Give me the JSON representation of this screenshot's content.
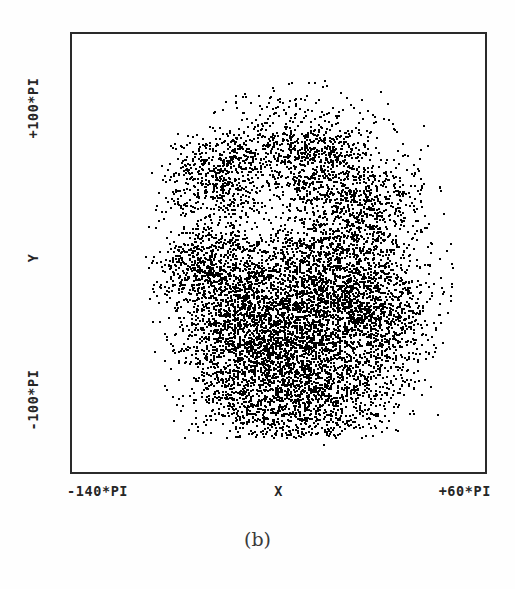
{
  "figure": {
    "caption": "(b)"
  },
  "axes": {
    "y_top_label": "+100*PI",
    "y_mid_label": "Y",
    "y_bottom_label": "-100*PI",
    "x_left_label": "-140*PI",
    "x_mid_label": "X",
    "x_right_label": "+60*PI"
  },
  "chart_data": {
    "type": "scatter",
    "title": "(b)",
    "xlabel": "X",
    "ylabel": "Y",
    "xtick_labels": [
      "-140*PI",
      "+60*PI"
    ],
    "ytick_labels": [
      "-100*PI",
      "+100*PI"
    ],
    "xlim": [
      -140,
      60
    ],
    "ylim": [
      -100,
      100
    ],
    "x_units": "PI",
    "y_units": "PI",
    "grid": false,
    "legend": null,
    "marker_color": "#000000",
    "background_color": "#ffffff",
    "frame_color": "#2a2a2a",
    "point_count_approx": 12000,
    "marker_size_px": 2,
    "cloud_extent_fraction": {
      "x_min": 0.22,
      "x_max": 0.88,
      "y_min": 0.15,
      "y_max": 0.89
    },
    "density_blobs": [
      {
        "cx": 0.34,
        "cy": 0.34,
        "rx": 0.075,
        "ry": 0.075,
        "weight": 0.055,
        "striation": 0.3
      },
      {
        "cx": 0.61,
        "cy": 0.3,
        "rx": 0.085,
        "ry": 0.07,
        "weight": 0.055,
        "striation": 0.3
      },
      {
        "cx": 0.52,
        "cy": 0.6,
        "rx": 0.15,
        "ry": 0.13,
        "weight": 0.2,
        "striation": 0.8
      },
      {
        "cx": 0.62,
        "cy": 0.72,
        "rx": 0.14,
        "ry": 0.13,
        "weight": 0.185,
        "striation": 0.85
      },
      {
        "cx": 0.45,
        "cy": 0.74,
        "rx": 0.12,
        "ry": 0.12,
        "weight": 0.15,
        "striation": 0.75
      },
      {
        "cx": 0.66,
        "cy": 0.5,
        "rx": 0.09,
        "ry": 0.09,
        "weight": 0.075,
        "striation": 0.55
      },
      {
        "cx": 0.38,
        "cy": 0.58,
        "rx": 0.08,
        "ry": 0.09,
        "weight": 0.06,
        "striation": 0.45
      },
      {
        "cx": 0.29,
        "cy": 0.53,
        "rx": 0.055,
        "ry": 0.05,
        "weight": 0.03,
        "striation": 0.2
      },
      {
        "cx": 0.74,
        "cy": 0.62,
        "rx": 0.075,
        "ry": 0.075,
        "weight": 0.05,
        "striation": 0.4
      },
      {
        "cx": 0.49,
        "cy": 0.27,
        "rx": 0.11,
        "ry": 0.06,
        "weight": 0.045,
        "striation": 0.25
      },
      {
        "cx": 0.72,
        "cy": 0.38,
        "rx": 0.08,
        "ry": 0.06,
        "weight": 0.035,
        "striation": 0.2
      },
      {
        "cx": 0.55,
        "cy": 0.86,
        "rx": 0.12,
        "ry": 0.05,
        "weight": 0.03,
        "striation": 0.3
      },
      {
        "cx": 0.55,
        "cy": 0.55,
        "rx": 0.3,
        "ry": 0.3,
        "weight": 0.03,
        "striation": 0.1
      }
    ]
  }
}
